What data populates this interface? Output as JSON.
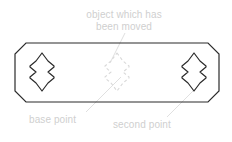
{
  "diagram": {
    "type": "technical-cad-illustration",
    "colors": {
      "outline": "#2b2b2b",
      "ghost_outline": "#d8d8d8",
      "label_text": "#cfcfcf",
      "leader_line": "#dcdcdc",
      "background": "#ffffff"
    },
    "plate": {
      "name": "chamfered-plate",
      "bounds": {
        "x": 15,
        "y": 43,
        "width": 204,
        "height": 59
      },
      "chamfer": 11,
      "stroke_width": 1.2
    },
    "shapes": [
      {
        "name": "left-lozenge",
        "state": "original",
        "center": {
          "x": 42,
          "y": 72
        },
        "style": "solid"
      },
      {
        "name": "center-lozenge-ghost",
        "state": "moved-ghost",
        "center": {
          "x": 117,
          "y": 72
        },
        "style": "dashed"
      },
      {
        "name": "right-lozenge",
        "state": "destination",
        "center": {
          "x": 194,
          "y": 72
        },
        "style": "solid"
      }
    ],
    "labels": [
      {
        "id": "object-moved",
        "text": "object which has\nbeen moved",
        "line1": "object which has",
        "line2": "been moved",
        "anchor": {
          "x": 124,
          "y": 30
        },
        "target": {
          "x": 112,
          "y": 62
        }
      },
      {
        "id": "base-point",
        "text": "base point",
        "anchor": {
          "x": 78,
          "y": 114
        },
        "target": {
          "x": 118,
          "y": 80
        }
      },
      {
        "id": "second-point",
        "text": "second point",
        "anchor": {
          "x": 171,
          "y": 119
        },
        "target": {
          "x": 196,
          "y": 84
        }
      }
    ],
    "leaders": [
      {
        "name": "leader-object-moved",
        "x1": 124,
        "y1": 32,
        "x2": 110,
        "y2": 63
      },
      {
        "name": "leader-base-point",
        "x1": 86,
        "y1": 113,
        "x2": 120,
        "y2": 78
      },
      {
        "name": "leader-second-point",
        "x1": 168,
        "y1": 118,
        "x2": 197,
        "y2": 85
      }
    ]
  },
  "text": {
    "object_moved_line1": "object which has",
    "object_moved_line2": "been moved",
    "base_point": "base point",
    "second_point": "second point"
  }
}
